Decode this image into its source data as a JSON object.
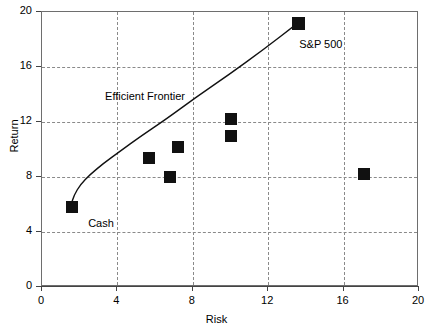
{
  "chart_data": {
    "type": "scatter",
    "title": "",
    "xlabel": "Risk",
    "ylabel": "Return",
    "xlim": [
      0,
      20
    ],
    "ylim": [
      0,
      20
    ],
    "xticks": [
      "0",
      "4",
      "8",
      "12",
      "16",
      "20"
    ],
    "yticks": [
      "0",
      "4",
      "8",
      "12",
      "16",
      "20"
    ],
    "grid": true,
    "legend": "none",
    "series": [
      {
        "name": "Asset classes",
        "marker": "filled-square",
        "color": "#111111",
        "points": [
          {
            "x": 1.6,
            "y": 5.8,
            "label": "Cash"
          },
          {
            "x": 5.7,
            "y": 9.4,
            "label": ""
          },
          {
            "x": 6.8,
            "y": 8.0,
            "label": ""
          },
          {
            "x": 7.2,
            "y": 10.2,
            "label": ""
          },
          {
            "x": 10.0,
            "y": 12.2,
            "label": ""
          },
          {
            "x": 10.0,
            "y": 11.0,
            "label": ""
          },
          {
            "x": 13.6,
            "y": 19.2,
            "label": "S&P 500"
          },
          {
            "x": 17.1,
            "y": 8.2,
            "label": ""
          }
        ]
      }
    ],
    "curve": {
      "name": "Efficient Frontier",
      "color": "#111111",
      "points": [
        {
          "x": 1.6,
          "y": 5.9
        },
        {
          "x": 1.75,
          "y": 6.6
        },
        {
          "x": 2.1,
          "y": 7.4
        },
        {
          "x": 2.6,
          "y": 8.1
        },
        {
          "x": 3.3,
          "y": 8.9
        },
        {
          "x": 4.2,
          "y": 9.8
        },
        {
          "x": 5.3,
          "y": 10.9
        },
        {
          "x": 6.6,
          "y": 12.1
        },
        {
          "x": 8.2,
          "y": 13.7
        },
        {
          "x": 10.0,
          "y": 15.4
        },
        {
          "x": 11.8,
          "y": 17.2
        },
        {
          "x": 13.6,
          "y": 19.1
        }
      ]
    },
    "annotations": [
      {
        "text": "Efficient Frontier",
        "x": 3.4,
        "y": 13.8
      },
      {
        "text": "Cash",
        "x": 2.5,
        "y": 4.6
      },
      {
        "text": "S&P 500",
        "x": 13.7,
        "y": 17.6
      }
    ]
  }
}
